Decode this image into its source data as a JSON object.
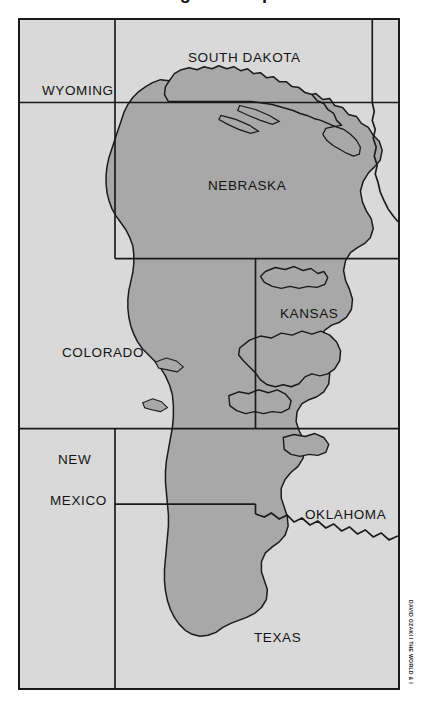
{
  "figure": {
    "title": "The Ogallala Aquifer",
    "credit": "DAVID OZAKI / THE WORLD & I"
  },
  "colors": {
    "page_background": "#ffffff",
    "map_background": "#d9d9d9",
    "aquifer_fill": "#a8a8a8",
    "border_line": "#1a1a1a",
    "label_text": "#141414"
  },
  "map": {
    "frame": {
      "x": 18,
      "y": 18,
      "width": 382,
      "height": 672
    },
    "legend_note": "Shaded area = extent of the Ogallala (High Plains) Aquifer",
    "state_labels": [
      {
        "name": "south-dakota",
        "text": "SOUTH DAKOTA",
        "x": 168,
        "y": 30
      },
      {
        "name": "wyoming",
        "text": "WYOMING",
        "x": 22,
        "y": 63
      },
      {
        "name": "nebraska",
        "text": "NEBRASKA",
        "x": 188,
        "y": 158
      },
      {
        "name": "kansas",
        "text": "KANSAS",
        "x": 260,
        "y": 286
      },
      {
        "name": "colorado",
        "text": "COLORADO",
        "x": 42,
        "y": 325
      },
      {
        "name": "new-mexico-line1",
        "text": "NEW",
        "x": 38,
        "y": 432
      },
      {
        "name": "new-mexico-line2",
        "text": "MEXICO",
        "x": 30,
        "y": 473
      },
      {
        "name": "oklahoma",
        "text": "OKLAHOMA",
        "x": 285,
        "y": 487
      },
      {
        "name": "texas",
        "text": "TEXAS",
        "x": 234,
        "y": 610
      }
    ]
  }
}
